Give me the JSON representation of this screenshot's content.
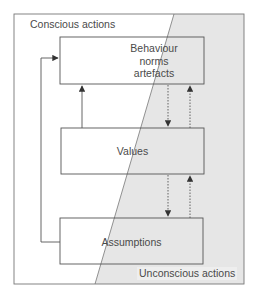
{
  "diagram": {
    "title": "",
    "regions": {
      "conscious_label": "Conscious actions",
      "unconscious_label": "Unconscious actions",
      "unconscious_fill": "#e6e6e6"
    },
    "boxes": [
      {
        "id": "behaviour",
        "lines": [
          "Behaviour",
          "norms",
          "artefacts"
        ]
      },
      {
        "id": "values",
        "lines": [
          "Values"
        ]
      },
      {
        "id": "assumptions",
        "lines": [
          "Assumptions"
        ]
      }
    ],
    "connections": [
      {
        "from": "values",
        "to": "behaviour",
        "style": "solid",
        "direction": "up"
      },
      {
        "from": "behaviour",
        "to": "values",
        "style": "dotted",
        "direction": "down"
      },
      {
        "from": "values",
        "to": "behaviour",
        "style": "dotted",
        "direction": "up"
      },
      {
        "from": "values",
        "to": "assumptions",
        "style": "dotted",
        "direction": "down"
      },
      {
        "from": "assumptions",
        "to": "values",
        "style": "dotted",
        "direction": "up"
      },
      {
        "from": "assumptions",
        "to": "behaviour",
        "style": "solid",
        "direction": "feedback-left"
      }
    ],
    "colors": {
      "line": "#555555",
      "frame": "#777777",
      "text": "#4a4a4a"
    }
  }
}
